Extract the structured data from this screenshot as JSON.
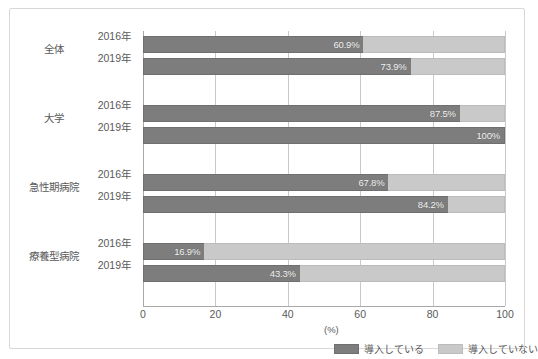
{
  "chart_data": {
    "type": "bar",
    "orientation": "horizontal",
    "stacked": true,
    "title": "",
    "xlabel": "(%)",
    "ylabel": "",
    "xlim": [
      0,
      100
    ],
    "xticks": [
      "0",
      "20",
      "40",
      "60",
      "80",
      "100"
    ],
    "grid": true,
    "legend_position": "bottom",
    "unit": "(%)",
    "series": [
      {
        "name": "導入している",
        "color": "#7d7d7d",
        "values": [
          60.9,
          73.9,
          87.5,
          100,
          67.8,
          84.2,
          16.9,
          43.3
        ]
      },
      {
        "name": "導入していない",
        "color": "#c9c9c9",
        "values": [
          39.1,
          26.1,
          12.5,
          0,
          32.2,
          15.8,
          83.1,
          56.7
        ]
      }
    ],
    "groups": [
      {
        "label": "全体",
        "rows": [
          {
            "year": "2016年",
            "yes": 60.9,
            "no": 39.1,
            "yes_label": "60.9%"
          },
          {
            "year": "2019年",
            "yes": 73.9,
            "no": 26.1,
            "yes_label": "73.9%"
          }
        ]
      },
      {
        "label": "大学",
        "rows": [
          {
            "year": "2016年",
            "yes": 87.5,
            "no": 12.5,
            "yes_label": "87.5%"
          },
          {
            "year": "2019年",
            "yes": 100,
            "no": 0,
            "yes_label": "100%"
          }
        ]
      },
      {
        "label": "急性期病院",
        "rows": [
          {
            "year": "2016年",
            "yes": 67.8,
            "no": 32.2,
            "yes_label": "67.8%"
          },
          {
            "year": "2019年",
            "yes": 84.2,
            "no": 15.8,
            "yes_label": "84.2%"
          }
        ]
      },
      {
        "label": "療養型病院",
        "rows": [
          {
            "year": "2016年",
            "yes": 16.9,
            "no": 83.1,
            "yes_label": "16.9%"
          },
          {
            "year": "2019年",
            "yes": 43.3,
            "no": 56.7,
            "yes_label": "43.3%"
          }
        ]
      }
    ],
    "legend": [
      {
        "label": "導入している",
        "color": "#7d7d7d"
      },
      {
        "label": "導入していない",
        "color": "#c9c9c9"
      }
    ]
  },
  "colors": {
    "bar_yes": "#7d7d7d",
    "bar_no": "#c9c9c9",
    "grid": "#c9c9c9",
    "axis": "#a8a8a8",
    "frame": "#d8d8d8",
    "text": "#5a5a5a",
    "value_text": "#f2f2f2"
  }
}
